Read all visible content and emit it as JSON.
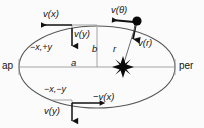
{
  "figure": {
    "type": "orbital-diagram",
    "background_color": "#fbfbfb",
    "stroke_color": "#4a4a4a",
    "text_color": "#141414",
    "marker_color": "#000000"
  },
  "apses": {
    "apoapsis_label": "ap",
    "periapsis_label": "per"
  },
  "axes": {
    "semi_major_label": "a",
    "semi_minor_label": "b"
  },
  "radius": {
    "label": "r"
  },
  "quadrants": [
    {
      "id": "upper-left",
      "label": "−x,+y"
    },
    {
      "id": "lower-left",
      "label": "−x,−y"
    }
  ],
  "vectors": [
    {
      "id": "vx-top",
      "label": "v(x)",
      "direction": "left"
    },
    {
      "id": "vy-top",
      "label": "v(y)",
      "direction": "down"
    },
    {
      "id": "vtheta",
      "label": "v(θ)",
      "direction": "left"
    },
    {
      "id": "vr",
      "label": "v(r)",
      "direction": "down"
    },
    {
      "id": "vx-bottom",
      "label": "−v(x)",
      "direction": "right"
    },
    {
      "id": "vy-bottom",
      "label": "v(y)",
      "direction": "down"
    }
  ],
  "bodies": [
    {
      "id": "star",
      "name": "star-at-focus",
      "glyph": "eight-point-star"
    },
    {
      "id": "orbiter",
      "name": "orbiting-body",
      "glyph": "filled-circle"
    }
  ]
}
